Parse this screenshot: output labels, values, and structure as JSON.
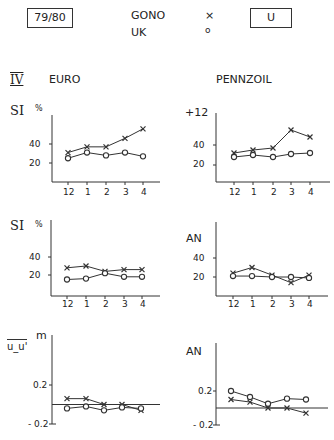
{
  "header": {
    "period_label": "79/80",
    "legend": [
      {
        "name": "GONO",
        "marker": "×"
      },
      {
        "name": "UK",
        "marker": "o"
      }
    ],
    "category_label": "U",
    "section_numeral": "IV",
    "left_column_title": "EURO",
    "right_column_title": "PENNZOIL"
  },
  "panels": {
    "euro_si": {
      "ylabel": "SI",
      "unit": "%",
      "ticks": [
        "40",
        "20"
      ],
      "x_ticks": [
        "12",
        "1",
        "2",
        "3",
        "4"
      ]
    },
    "pennzoil_si": {
      "ylabel": "+12",
      "ticks": [
        "40",
        "20"
      ],
      "x_ticks": [
        "12",
        "1",
        "2",
        "3",
        "4"
      ]
    },
    "euro_si2": {
      "ylabel": "SI",
      "unit": "%",
      "ticks": [
        "40",
        "20"
      ],
      "x_ticks": [
        "12",
        "1",
        "2",
        "3",
        "4"
      ]
    },
    "pennzoil_an": {
      "ylabel": "AN",
      "ticks": [
        "40",
        "20"
      ],
      "x_ticks": [
        "12",
        "1",
        "2",
        "3",
        "4"
      ]
    },
    "euro_uu": {
      "ylabel": "u_u'",
      "unit": "m",
      "ticks": [
        "0.2",
        "- 0.2"
      ]
    },
    "pennzoil_an2": {
      "ylabel": "AN",
      "ticks": [
        "0.2",
        "- 0.2"
      ]
    }
  },
  "chart_data": [
    {
      "type": "line",
      "title": "EURO SI (%)",
      "ylabel": "SI %",
      "xlabel": "",
      "categories": [
        "12",
        "1",
        "2",
        "3",
        "4"
      ],
      "series": [
        {
          "name": "GONO",
          "marker": "x",
          "values": [
            31,
            37,
            37,
            46,
            56
          ]
        },
        {
          "name": "UK",
          "marker": "o",
          "values": [
            25,
            31,
            28,
            31,
            27
          ]
        }
      ],
      "yticks": [
        20,
        40
      ],
      "grid": false
    },
    {
      "type": "line",
      "title": "PENNZOIL +12",
      "ylabel": "+12",
      "xlabel": "",
      "categories": [
        "12",
        "1",
        "2",
        "3",
        "4"
      ],
      "series": [
        {
          "name": "GONO",
          "marker": "x",
          "values": [
            32,
            35,
            37,
            55,
            48
          ]
        },
        {
          "name": "UK",
          "marker": "o",
          "values": [
            28,
            30,
            28,
            31,
            32
          ]
        }
      ],
      "yticks": [
        20,
        40
      ],
      "grid": false
    },
    {
      "type": "line",
      "title": "EURO SI (%)",
      "ylabel": "SI %",
      "xlabel": "",
      "categories": [
        "12",
        "1",
        "2",
        "3",
        "4"
      ],
      "series": [
        {
          "name": "GONO",
          "marker": "x",
          "values": [
            28,
            30,
            24,
            26,
            26
          ]
        },
        {
          "name": "UK",
          "marker": "o",
          "values": [
            15,
            16,
            22,
            18,
            18
          ]
        }
      ],
      "yticks": [
        20,
        40
      ],
      "grid": false
    },
    {
      "type": "line",
      "title": "PENNZOIL AN",
      "ylabel": "AN",
      "xlabel": "",
      "categories": [
        "12",
        "1",
        "2",
        "3",
        "4"
      ],
      "series": [
        {
          "name": "GONO",
          "marker": "x",
          "values": [
            24,
            30,
            22,
            14,
            22
          ]
        },
        {
          "name": "UK",
          "marker": "o",
          "values": [
            21,
            21,
            20,
            20,
            19
          ]
        }
      ],
      "yticks": [
        20,
        40
      ],
      "grid": false
    },
    {
      "type": "line",
      "title": "EURO u_u' (m)",
      "ylabel": "u_u' m",
      "xlabel": "",
      "categories": [
        "12",
        "1",
        "2",
        "3",
        "4"
      ],
      "series": [
        {
          "name": "GONO",
          "marker": "x",
          "values": [
            0.06,
            0.06,
            0.0,
            0.0,
            -0.06
          ]
        },
        {
          "name": "UK",
          "marker": "o",
          "values": [
            -0.04,
            -0.02,
            -0.06,
            -0.03,
            -0.04
          ]
        }
      ],
      "yticks": [
        -0.2,
        0.2
      ],
      "zero_line": true,
      "grid": false
    },
    {
      "type": "line",
      "title": "PENNZOIL AN",
      "ylabel": "AN",
      "xlabel": "",
      "categories": [
        "12",
        "1",
        "2",
        "3",
        "4"
      ],
      "series": [
        {
          "name": "GONO",
          "marker": "x",
          "values": [
            0.1,
            0.07,
            0.0,
            0.0,
            -0.06
          ]
        },
        {
          "name": "UK",
          "marker": "o",
          "values": [
            0.2,
            0.13,
            0.05,
            0.11,
            0.1
          ]
        }
      ],
      "yticks": [
        -0.2,
        0.2
      ],
      "zero_line": true,
      "grid": false
    }
  ]
}
